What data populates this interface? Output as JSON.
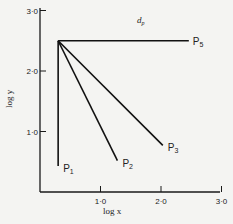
{
  "chart_data": {
    "type": "line",
    "xlabel": "log x",
    "ylabel": "log y",
    "xlim": [
      0,
      3.0
    ],
    "ylim": [
      0,
      3.0
    ],
    "xticks": [
      "1·0",
      "2·0",
      "3·0"
    ],
    "yticks": [
      "1·0",
      "2·0",
      "3·0"
    ],
    "grid": false,
    "legend": "none (lines labeled at endpoints)",
    "series": [
      {
        "name": "P1",
        "label_main": "P",
        "label_sub": "1",
        "points": [
          [
            0.3,
            2.5
          ],
          [
            0.3,
            0.43
          ]
        ]
      },
      {
        "name": "P2",
        "label_main": "P",
        "label_sub": "2",
        "points": [
          [
            0.3,
            2.5
          ],
          [
            1.28,
            0.52
          ]
        ]
      },
      {
        "name": "P3",
        "label_main": "P",
        "label_sub": "3",
        "points": [
          [
            0.3,
            2.5
          ],
          [
            2.03,
            0.77
          ]
        ]
      },
      {
        "name": "P5",
        "label_main": "P",
        "label_sub": "5",
        "points": [
          [
            0.3,
            2.5
          ],
          [
            2.46,
            2.5
          ]
        ]
      }
    ],
    "annotation": {
      "main": "d",
      "sub": "p"
    }
  }
}
